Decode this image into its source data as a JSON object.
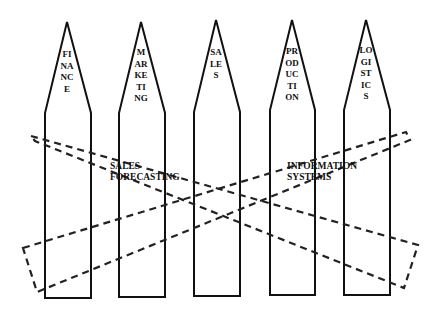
{
  "diagram": {
    "pickets": [
      {
        "label": "FINANCE"
      },
      {
        "label": "MARKETING"
      },
      {
        "label": "SALES"
      },
      {
        "label": "PRODUCTION"
      },
      {
        "label": "LOGISTICS"
      }
    ],
    "cross_functional": [
      {
        "line1": "SALES",
        "line2": "FORECASTING"
      },
      {
        "line1": "INFORMATION",
        "line2": "SYSTEMS"
      }
    ],
    "colors": {
      "stroke": "#111111",
      "background": "#ffffff"
    }
  }
}
